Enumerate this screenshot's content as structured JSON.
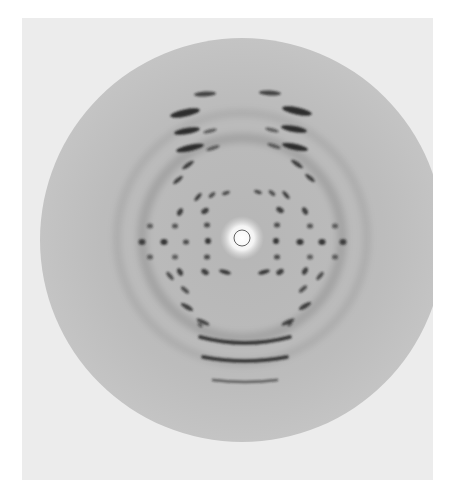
{
  "image": {
    "subject": "X-ray fiber diffraction pattern",
    "width": 452,
    "height": 489
  },
  "colors": {
    "border": "#ffffff",
    "paper": "#ececec",
    "disc_outer": "#c4c4c4",
    "disc_inner": "#b6b6b6",
    "center_glow": "#ffffff",
    "spot": "#1e1e1e"
  },
  "paper": {
    "x": 22,
    "y": 18,
    "w": 411,
    "h": 462
  },
  "disc": {
    "cx": 242,
    "cy": 240,
    "r": 202
  },
  "beamstop": {
    "cx": 242,
    "cy": 238,
    "r_glow": 22,
    "r_ring": 8
  },
  "layer_line_spots": [
    {
      "x": 205,
      "y": 94,
      "rx": 11,
      "ry": 2.5,
      "rot": -3,
      "o": 0.75
    },
    {
      "x": 270,
      "y": 93,
      "rx": 11,
      "ry": 2.5,
      "rot": 3,
      "o": 0.75
    },
    {
      "x": 185,
      "y": 113,
      "rx": 15,
      "ry": 3.5,
      "rot": -12,
      "o": 0.9
    },
    {
      "x": 297,
      "y": 111,
      "rx": 15,
      "ry": 3.5,
      "rot": 12,
      "o": 0.9
    },
    {
      "x": 187,
      "y": 131,
      "rx": 13,
      "ry": 3,
      "rot": -10,
      "o": 0.9
    },
    {
      "x": 210,
      "y": 131,
      "rx": 7,
      "ry": 1.8,
      "rot": -15,
      "o": 0.6
    },
    {
      "x": 294,
      "y": 129,
      "rx": 13,
      "ry": 3,
      "rot": 10,
      "o": 0.9
    },
    {
      "x": 272,
      "y": 130,
      "rx": 7,
      "ry": 1.8,
      "rot": 15,
      "o": 0.6
    },
    {
      "x": 190,
      "y": 148,
      "rx": 14,
      "ry": 3,
      "rot": -12,
      "o": 0.9
    },
    {
      "x": 213,
      "y": 148,
      "rx": 7,
      "ry": 1.8,
      "rot": -18,
      "o": 0.6
    },
    {
      "x": 295,
      "y": 147,
      "rx": 13,
      "ry": 3,
      "rot": 12,
      "o": 0.9
    },
    {
      "x": 274,
      "y": 146,
      "rx": 7,
      "ry": 1.8,
      "rot": 18,
      "o": 0.6
    },
    {
      "x": 188,
      "y": 165,
      "rx": 7,
      "ry": 2,
      "rot": -35,
      "o": 0.8
    },
    {
      "x": 297,
      "y": 164,
      "rx": 7,
      "ry": 2,
      "rot": 35,
      "o": 0.8
    },
    {
      "x": 178,
      "y": 180,
      "rx": 6,
      "ry": 2,
      "rot": -40,
      "o": 0.8
    },
    {
      "x": 310,
      "y": 178,
      "rx": 6,
      "ry": 2,
      "rot": 40,
      "o": 0.8
    },
    {
      "x": 198,
      "y": 197,
      "rx": 5,
      "ry": 1.8,
      "rot": -50,
      "o": 0.8
    },
    {
      "x": 212,
      "y": 195,
      "rx": 4,
      "ry": 1.8,
      "rot": -40,
      "o": 0.7
    },
    {
      "x": 226,
      "y": 193,
      "rx": 4,
      "ry": 1.8,
      "rot": -20,
      "o": 0.7
    },
    {
      "x": 286,
      "y": 195,
      "rx": 5,
      "ry": 1.8,
      "rot": 50,
      "o": 0.8
    },
    {
      "x": 272,
      "y": 193,
      "rx": 4,
      "ry": 1.8,
      "rot": 40,
      "o": 0.7
    },
    {
      "x": 258,
      "y": 192,
      "rx": 4,
      "ry": 1.8,
      "rot": 20,
      "o": 0.7
    },
    {
      "x": 180,
      "y": 212,
      "rx": 4,
      "ry": 2.5,
      "rot": -60,
      "o": 0.8
    },
    {
      "x": 205,
      "y": 211,
      "rx": 4,
      "ry": 2.5,
      "rot": -30,
      "o": 0.8
    },
    {
      "x": 305,
      "y": 211,
      "rx": 4,
      "ry": 2.5,
      "rot": 60,
      "o": 0.8
    },
    {
      "x": 280,
      "y": 210,
      "rx": 4,
      "ry": 2.5,
      "rot": 30,
      "o": 0.8
    },
    {
      "x": 150,
      "y": 226,
      "rx": 3,
      "ry": 2.5,
      "rot": 0,
      "o": 0.6
    },
    {
      "x": 175,
      "y": 226,
      "rx": 3,
      "ry": 2.5,
      "rot": 0,
      "o": 0.65
    },
    {
      "x": 207,
      "y": 225,
      "rx": 3,
      "ry": 2.5,
      "rot": 0,
      "o": 0.7
    },
    {
      "x": 277,
      "y": 225,
      "rx": 3,
      "ry": 2.5,
      "rot": 0,
      "o": 0.7
    },
    {
      "x": 310,
      "y": 226,
      "rx": 3,
      "ry": 2.5,
      "rot": 0,
      "o": 0.65
    },
    {
      "x": 335,
      "y": 226,
      "rx": 3,
      "ry": 2.5,
      "rot": 0,
      "o": 0.6
    },
    {
      "x": 142,
      "y": 242,
      "rx": 3.5,
      "ry": 3,
      "rot": 0,
      "o": 0.75
    },
    {
      "x": 164,
      "y": 242,
      "rx": 3.5,
      "ry": 3,
      "rot": 0,
      "o": 0.85
    },
    {
      "x": 186,
      "y": 242,
      "rx": 3,
      "ry": 2.5,
      "rot": 0,
      "o": 0.7
    },
    {
      "x": 208,
      "y": 241,
      "rx": 3,
      "ry": 3,
      "rot": 0,
      "o": 0.85
    },
    {
      "x": 276,
      "y": 241,
      "rx": 3,
      "ry": 3,
      "rot": 0,
      "o": 0.85
    },
    {
      "x": 300,
      "y": 242,
      "rx": 3.5,
      "ry": 3,
      "rot": 0,
      "o": 0.85
    },
    {
      "x": 322,
      "y": 242,
      "rx": 3.5,
      "ry": 3,
      "rot": 0,
      "o": 0.85
    },
    {
      "x": 343,
      "y": 242,
      "rx": 3.5,
      "ry": 3,
      "rot": 0,
      "o": 0.75
    },
    {
      "x": 150,
      "y": 257,
      "rx": 3,
      "ry": 2.5,
      "rot": 0,
      "o": 0.6
    },
    {
      "x": 175,
      "y": 257,
      "rx": 3,
      "ry": 2.5,
      "rot": 0,
      "o": 0.6
    },
    {
      "x": 207,
      "y": 257,
      "rx": 3,
      "ry": 2.5,
      "rot": 0,
      "o": 0.7
    },
    {
      "x": 277,
      "y": 257,
      "rx": 3,
      "ry": 2.5,
      "rot": 0,
      "o": 0.7
    },
    {
      "x": 310,
      "y": 257,
      "rx": 3,
      "ry": 2.5,
      "rot": 0,
      "o": 0.6
    },
    {
      "x": 335,
      "y": 257,
      "rx": 3,
      "ry": 2.5,
      "rot": 0,
      "o": 0.6
    },
    {
      "x": 180,
      "y": 272,
      "rx": 4,
      "ry": 2.5,
      "rot": 60,
      "o": 0.8
    },
    {
      "x": 205,
      "y": 272,
      "rx": 4,
      "ry": 2.5,
      "rot": 30,
      "o": 0.8
    },
    {
      "x": 305,
      "y": 271,
      "rx": 4,
      "ry": 2.5,
      "rot": -60,
      "o": 0.8
    },
    {
      "x": 280,
      "y": 272,
      "rx": 4,
      "ry": 2.5,
      "rot": -30,
      "o": 0.8
    },
    {
      "x": 225,
      "y": 272,
      "rx": 6,
      "ry": 2,
      "rot": 15,
      "o": 0.85
    },
    {
      "x": 264,
      "y": 272,
      "rx": 6,
      "ry": 2,
      "rot": -15,
      "o": 0.85
    },
    {
      "x": 170,
      "y": 276,
      "rx": 5,
      "ry": 2,
      "rot": 50,
      "o": 0.7
    },
    {
      "x": 320,
      "y": 276,
      "rx": 5,
      "ry": 2,
      "rot": -50,
      "o": 0.7
    },
    {
      "x": 185,
      "y": 290,
      "rx": 5,
      "ry": 2,
      "rot": 40,
      "o": 0.7
    },
    {
      "x": 303,
      "y": 289,
      "rx": 5,
      "ry": 2,
      "rot": -40,
      "o": 0.7
    },
    {
      "x": 187,
      "y": 307,
      "rx": 7,
      "ry": 2.2,
      "rot": 30,
      "o": 0.8
    },
    {
      "x": 305,
      "y": 306,
      "rx": 7,
      "ry": 2.2,
      "rot": -30,
      "o": 0.8
    },
    {
      "x": 203,
      "y": 322,
      "rx": 7,
      "ry": 2,
      "rot": 25,
      "o": 0.75
    },
    {
      "x": 288,
      "y": 322,
      "rx": 7,
      "ry": 2,
      "rot": -25,
      "o": 0.75
    },
    {
      "x": 200,
      "y": 325,
      "rx": 3,
      "ry": 1.5,
      "rot": 40,
      "o": 0.6
    },
    {
      "x": 290,
      "y": 324,
      "rx": 3,
      "ry": 1.5,
      "rot": -40,
      "o": 0.6
    }
  ],
  "arc_bands": [
    {
      "cx": 245,
      "y": 343,
      "half_w": 45,
      "sag": 6,
      "w": 3.5,
      "o": 0.85
    },
    {
      "cx": 245,
      "y": 361,
      "half_w": 42,
      "sag": 4,
      "w": 3.5,
      "o": 0.85
    },
    {
      "cx": 245,
      "y": 382,
      "half_w": 32,
      "sag": 2,
      "w": 2.5,
      "o": 0.6
    }
  ],
  "rings": [
    {
      "r": 100,
      "o": 0.12,
      "w": 10
    },
    {
      "r": 125,
      "o": 0.08,
      "w": 8
    }
  ]
}
